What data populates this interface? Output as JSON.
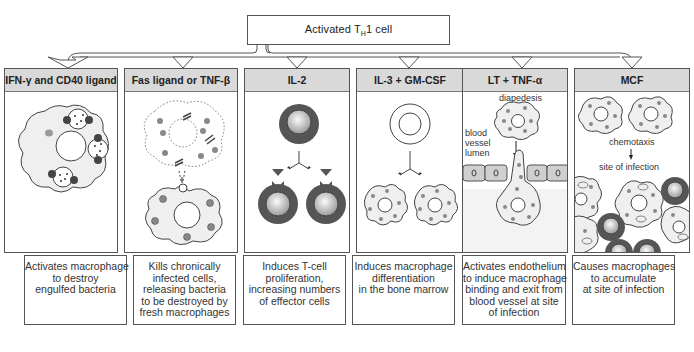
{
  "root": {
    "label_prefix": "Activated T",
    "label_sub": "H",
    "label_suffix": "1 cell"
  },
  "panels": [
    {
      "title": "IFN-γ and CD40 ligand",
      "description": [
        "Activates macrophage",
        "to destroy",
        "engulfed bacteria"
      ]
    },
    {
      "title": "Fas ligand or TNF-β",
      "description": [
        "Kills chronically",
        "infected cells,",
        "releasing bacteria",
        "to be destroyed by",
        "fresh macrophages"
      ]
    },
    {
      "title": "IL-2",
      "description": [
        "Induces T-cell",
        "proliferation,",
        "increasing numbers",
        "of effector cells"
      ]
    },
    {
      "title": "IL-3 + GM-CSF",
      "description": [
        "Induces macrophage",
        "differentiation",
        "in the bone marrow"
      ]
    },
    {
      "title": "LT + TNF-α",
      "description": [
        "Activates endothelium",
        "to induce macrophage",
        "binding and exit from",
        "blood vessel at site",
        "of infection"
      ],
      "labels": {
        "diapedesis": "diapedesis",
        "lumen_1": "blood",
        "lumen_2": "vessel",
        "lumen_3": "lumen"
      }
    },
    {
      "title": "MCF",
      "description": [
        "Causes macrophages",
        "to accumulate",
        "at site of infection"
      ],
      "labels": {
        "chemotaxis": "chemotaxis",
        "site": "site of infection"
      }
    }
  ],
  "colors": {
    "header_bg": "#d9d9d9",
    "cell_fill": "#efefef",
    "tcell_dark": "#555555",
    "dot": "#888888",
    "endothelium": "#cfcfcf"
  }
}
